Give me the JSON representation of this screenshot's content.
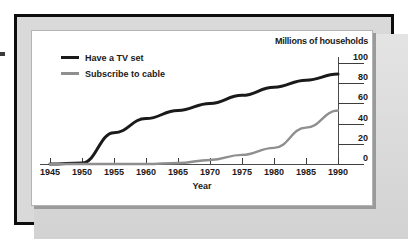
{
  "chart_data": {
    "type": "line",
    "title": "",
    "xlabel": "Year",
    "ylabel": "Millions of households",
    "xlim": [
      1945,
      1990
    ],
    "ylim": [
      0,
      100
    ],
    "xticks": [
      1945,
      1950,
      1955,
      1960,
      1965,
      1970,
      1975,
      1980,
      1985,
      1990
    ],
    "xtick_labels": [
      "1945",
      "1950",
      "1955",
      "1960",
      "1965",
      "1970",
      "1975",
      "1980",
      "1985",
      "1990"
    ],
    "yticks": [
      0,
      20,
      40,
      60,
      80,
      100
    ],
    "ytick_labels": [
      "0",
      "20",
      "40",
      "60",
      "80",
      "100"
    ],
    "y_axis_position": "right",
    "grid": false,
    "legend_position": "upper-left",
    "x": [
      1945,
      1950,
      1955,
      1960,
      1965,
      1970,
      1975,
      1980,
      1985,
      1990
    ],
    "series": [
      {
        "name": "Have a TV set",
        "color": "#1a1a1a",
        "values": [
          0,
          1,
          31,
          45,
          53,
          60,
          68,
          76,
          83,
          89
        ]
      },
      {
        "name": "Subscribe to cable",
        "color": "#8f8f8f",
        "values": [
          0,
          0,
          0,
          0,
          1,
          4,
          9,
          16,
          36,
          53
        ]
      }
    ]
  },
  "legend": {
    "items": [
      {
        "label": "Have a TV set",
        "color": "#1a1a1a"
      },
      {
        "label": "Subscribe to cable",
        "color": "#8f8f8f"
      }
    ]
  },
  "axes": {
    "y_title": "Millions of households",
    "x_title": "Year"
  },
  "colors": {
    "frame": "#0d0d0d",
    "mat": "#d9d9d9",
    "panel": "#ffffff",
    "shadow": "#9a9a9a",
    "tv_line": "#1a1a1a",
    "cable_line": "#8f8f8f"
  }
}
